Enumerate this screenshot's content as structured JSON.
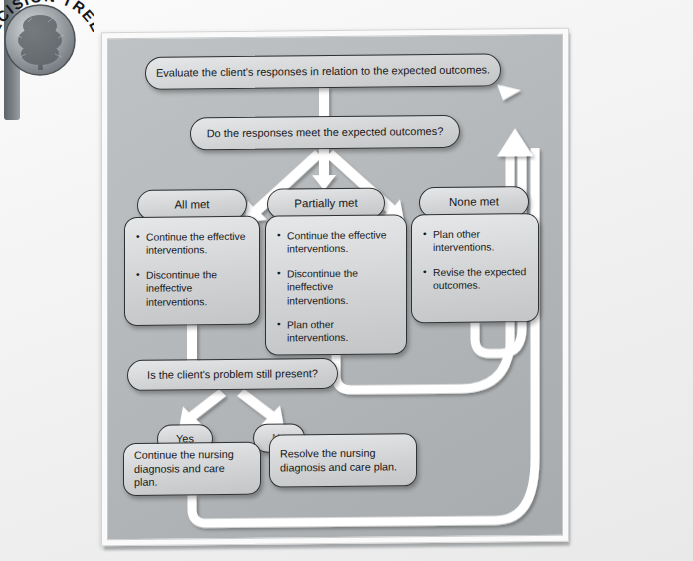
{
  "badge": {
    "label": "DECISION TREE",
    "icon": "tree-badge-icon"
  },
  "diagram": {
    "nodes": {
      "evaluate": "Evaluate the client's responses in relation to the expected outcomes.",
      "question1": "Do the responses meet the expected outcomes?",
      "all_met": "All met",
      "partially_met": "Partially met",
      "none_met": "None met",
      "question2": "Is the client's problem still present?",
      "yes": "Yes",
      "no": "No",
      "continue_plan": "Continue the nursing diagnosis and care plan.",
      "resolve_plan": "Resolve the nursing diagnosis and care plan."
    },
    "actions": {
      "all_met": [
        "Continue the effective interventions.",
        "Discontinue the ineffective interventions."
      ],
      "partially_met": [
        "Continue the effective interventions.",
        "Discontinue the ineffective interventions.",
        "Plan other interventions."
      ],
      "none_met": [
        "Plan other interventions.",
        "Revise the expected outcomes."
      ]
    },
    "colors": {
      "panel": "#b4b7b9",
      "node_fill": "#d7d8da",
      "node_border": "#2f3234",
      "connector": "#ffffff",
      "text": "#16181a"
    }
  }
}
